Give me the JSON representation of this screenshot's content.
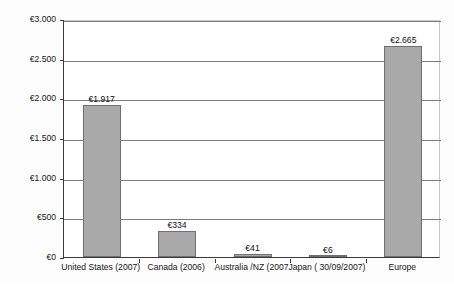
{
  "chart_data": {
    "type": "bar",
    "title": "",
    "xlabel": "",
    "ylabel": "Total RI in billions Euro",
    "ylim": [
      0,
      3000
    ],
    "ytick_values": [
      0,
      500,
      1000,
      1500,
      2000,
      2500,
      3000
    ],
    "ytick_labels": [
      "€0",
      "€500",
      "€1.000",
      "€1.500",
      "€2.000",
      "€2.500",
      "€3.000"
    ],
    "grid": true,
    "legend": null,
    "currency_symbol": "€",
    "categories": [
      "United States (2007)",
      "Canada (2006)",
      "Australia /NZ (2007",
      "Japan ( 30/09/2007)",
      "Europe"
    ],
    "values": [
      1917,
      334,
      41,
      6,
      2665
    ],
    "data_labels": [
      "€1.917",
      "€334",
      "€41",
      "€6",
      "€2.665"
    ],
    "bar_color": "#a9a9a9",
    "bar_border_color": "#6f6f6f",
    "axis_color": "#3a3a3a",
    "gridline_color": "#7d7d7d",
    "background_color": "#ffffff"
  }
}
